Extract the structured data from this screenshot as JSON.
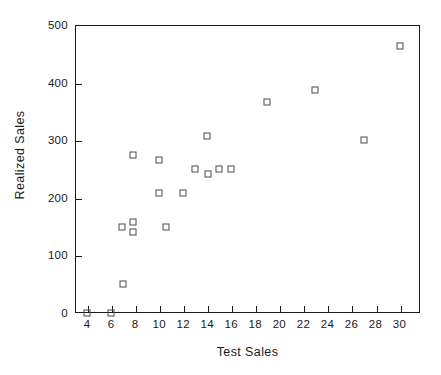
{
  "chart_data": {
    "type": "scatter",
    "title": "",
    "xlabel": "Test Sales",
    "ylabel": "Realized Sales",
    "xlim": [
      3,
      31.7
    ],
    "ylim": [
      0,
      500
    ],
    "xticks": [
      4,
      6,
      8,
      10,
      12,
      14,
      16,
      18,
      20,
      22,
      24,
      26,
      28,
      30
    ],
    "yticks": [
      0,
      100,
      200,
      300,
      400,
      500
    ],
    "xtick_labels": [
      "4",
      "6",
      "8",
      "10",
      "12",
      "14",
      "16",
      "18",
      "20",
      "22",
      "24",
      "26",
      "28",
      "30"
    ],
    "ytick_labels": [
      "0",
      "100",
      "200",
      "300",
      "400",
      "500"
    ],
    "grid": false,
    "legend": null,
    "marker": "open-square",
    "marker_color": "#4a4a52",
    "axis_color": "#1a1a1a",
    "background": "#ffffff",
    "points": [
      {
        "x": 4.0,
        "y": 0
      },
      {
        "x": 6.0,
        "y": 0
      },
      {
        "x": 7.0,
        "y": 50
      },
      {
        "x": 6.9,
        "y": 150
      },
      {
        "x": 7.8,
        "y": 158
      },
      {
        "x": 7.8,
        "y": 141
      },
      {
        "x": 7.8,
        "y": 275
      },
      {
        "x": 10.0,
        "y": 265
      },
      {
        "x": 10.0,
        "y": 208
      },
      {
        "x": 10.6,
        "y": 150
      },
      {
        "x": 12.0,
        "y": 208
      },
      {
        "x": 13.0,
        "y": 250
      },
      {
        "x": 14.0,
        "y": 307
      },
      {
        "x": 14.1,
        "y": 242
      },
      {
        "x": 15.0,
        "y": 250
      },
      {
        "x": 16.0,
        "y": 250
      },
      {
        "x": 19.0,
        "y": 366
      },
      {
        "x": 23.0,
        "y": 388
      },
      {
        "x": 27.0,
        "y": 300
      },
      {
        "x": 30.0,
        "y": 463
      }
    ]
  }
}
